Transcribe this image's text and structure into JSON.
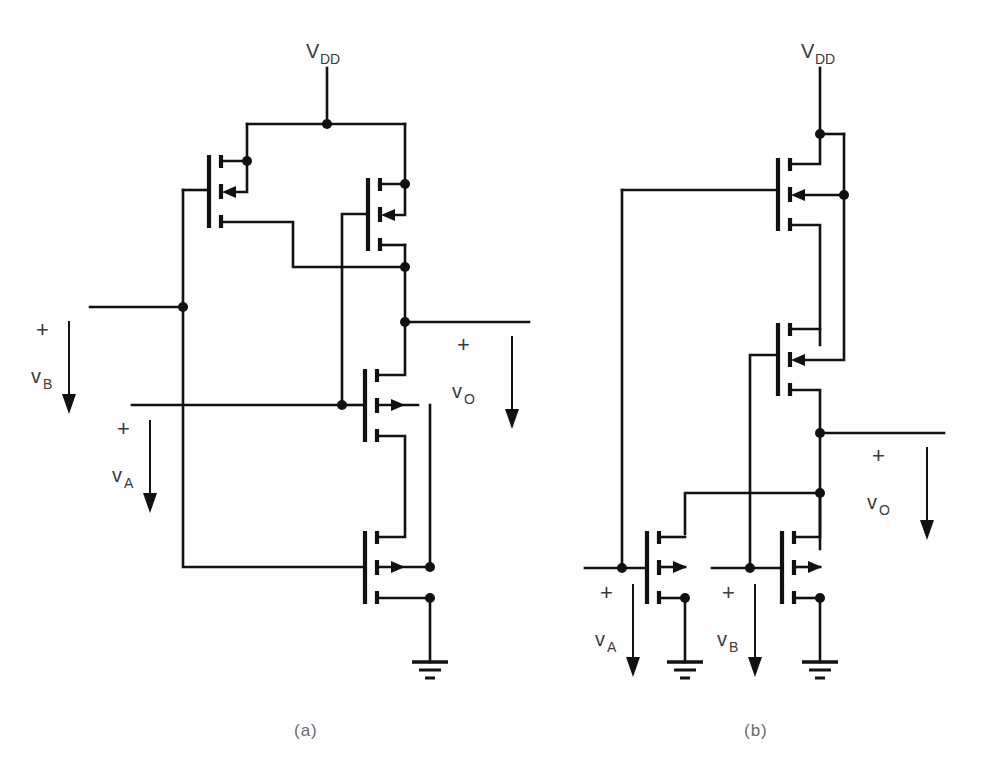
{
  "figure": {
    "background": "#ffffff",
    "ink": "#111111",
    "text_color": "#3a3a3a",
    "width": 981,
    "height": 772
  },
  "captions": {
    "a": "(a)",
    "b": "(b)"
  },
  "circuit_a": {
    "name": "CMOS NOR-style gate (a)",
    "supply": {
      "label_main": "V",
      "label_sub": "DD"
    },
    "inputs": [
      {
        "id": "vB",
        "plus": "+",
        "label_main": "v",
        "label_sub": "B"
      },
      {
        "id": "vA",
        "plus": "+",
        "label_main": "v",
        "label_sub": "A"
      }
    ],
    "output": {
      "id": "vO",
      "plus": "+",
      "label_main": "v",
      "label_sub": "O"
    },
    "devices": [
      {
        "id": "MP1",
        "type": "pmos",
        "note": "upper-left p-channel, gate driven by vB"
      },
      {
        "id": "MP2",
        "type": "pmos",
        "note": "upper-right p-channel, gate driven by vA"
      },
      {
        "id": "MN1",
        "type": "nmos",
        "note": "upper n-channel, gate driven by vA"
      },
      {
        "id": "MN2",
        "type": "nmos",
        "note": "lower n-channel, gate driven by vB"
      }
    ]
  },
  "circuit_b": {
    "name": "CMOS NAND-style gate (b)",
    "supply": {
      "label_main": "V",
      "label_sub": "DD"
    },
    "inputs": [
      {
        "id": "vA",
        "plus": "+",
        "label_main": "v",
        "label_sub": "A"
      },
      {
        "id": "vB",
        "plus": "+",
        "label_main": "v",
        "label_sub": "B"
      }
    ],
    "output": {
      "id": "vO",
      "plus": "+",
      "label_main": "v",
      "label_sub": "O"
    },
    "devices": [
      {
        "id": "MP1",
        "type": "pmos",
        "note": "upper p-channel in series, gate driven by vA"
      },
      {
        "id": "MP2",
        "type": "pmos",
        "note": "lower p-channel in series, gate driven by vB"
      },
      {
        "id": "MN1",
        "type": "nmos",
        "note": "left n-channel, gate driven by vA"
      },
      {
        "id": "MN2",
        "type": "nmos",
        "note": "right n-channel, gate driven by vB"
      }
    ]
  }
}
